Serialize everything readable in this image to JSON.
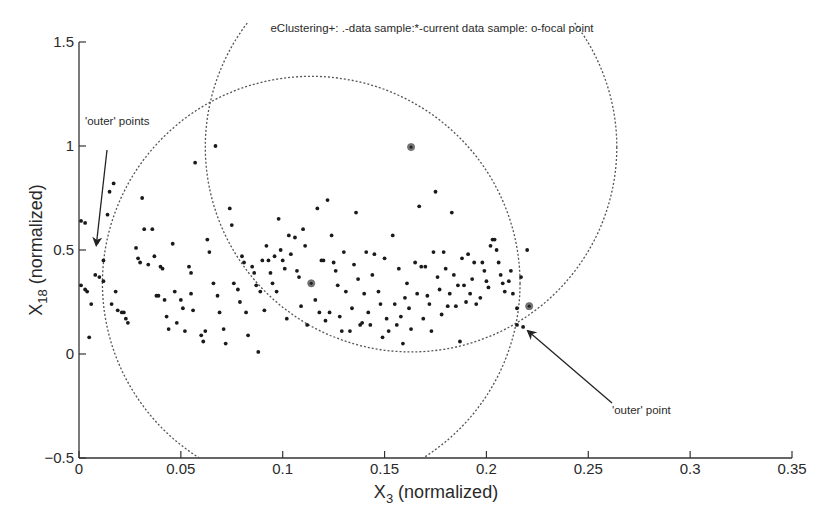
{
  "chart_data": {
    "type": "scatter",
    "title": "eClustering+: .-data sample:*-current data sample: o-focal point",
    "xlabel": "X3 (normalized)",
    "xlabel_main": "X",
    "xlabel_sub": "3",
    "xlabel_rest": " (normalized)",
    "ylabel": "X18 (normalized)",
    "ylabel_main": "X",
    "ylabel_sub": "18",
    "ylabel_rest": " (normalized)",
    "xlim": [
      0,
      0.35
    ],
    "ylim": [
      -0.5,
      1.5
    ],
    "xticks": [
      0,
      0.05,
      0.1,
      0.15,
      0.2,
      0.25,
      0.3,
      0.35
    ],
    "xtick_labels": [
      "0",
      "0.05",
      "0.1",
      "0.15",
      "0.2",
      "0.25",
      "0.3",
      "0.35"
    ],
    "yticks": [
      -0.5,
      0,
      0.5,
      1,
      1.5
    ],
    "ytick_labels": [
      "-0.5",
      "0",
      "0.5",
      "1",
      "1.5"
    ],
    "grid": false,
    "legend": "none",
    "focal_points": [
      {
        "x": 0.163,
        "y": 0.995
      },
      {
        "x": 0.114,
        "y": 0.34
      },
      {
        "x": 0.221,
        "y": 0.23
      }
    ],
    "clusters": [
      {
        "center_x": 0.114,
        "center_y": 0.34,
        "radius_x": 0.1025,
        "radius_y": 0.995
      },
      {
        "center_x": 0.163,
        "center_y": 0.995,
        "radius_x": 0.101,
        "radius_y": 0.985
      }
    ],
    "annotations": [
      {
        "text": "'outer' points",
        "x": 0.001,
        "y": 1.09,
        "arrow_to_x": 0.008,
        "arrow_to_y": 0.62
      },
      {
        "text": "'outer' point",
        "x": 0.22,
        "y": -0.21,
        "arrow_to_x": 0.219,
        "arrow_to_y": 0.15
      }
    ],
    "points": [
      {
        "x": 0.001,
        "y": 0.64
      },
      {
        "x": 0.003,
        "y": 0.63
      },
      {
        "x": 0.001,
        "y": 0.33
      },
      {
        "x": 0.003,
        "y": 0.31
      },
      {
        "x": 0.004,
        "y": 0.3
      },
      {
        "x": 0.006,
        "y": 0.24
      },
      {
        "x": 0.005,
        "y": 0.08
      },
      {
        "x": 0.009,
        "y": 0.54
      },
      {
        "x": 0.008,
        "y": 0.38
      },
      {
        "x": 0.01,
        "y": 0.37
      },
      {
        "x": 0.012,
        "y": 0.35
      },
      {
        "x": 0.012,
        "y": 0.45
      },
      {
        "x": 0.014,
        "y": 0.67
      },
      {
        "x": 0.015,
        "y": 0.78
      },
      {
        "x": 0.017,
        "y": 0.82
      },
      {
        "x": 0.016,
        "y": 0.24
      },
      {
        "x": 0.018,
        "y": 0.3
      },
      {
        "x": 0.019,
        "y": 0.21
      },
      {
        "x": 0.021,
        "y": 0.2
      },
      {
        "x": 0.022,
        "y": 0.2
      },
      {
        "x": 0.023,
        "y": 0.17
      },
      {
        "x": 0.024,
        "y": 0.15
      },
      {
        "x": 0.028,
        "y": 0.51
      },
      {
        "x": 0.029,
        "y": 0.46
      },
      {
        "x": 0.03,
        "y": 0.44
      },
      {
        "x": 0.031,
        "y": 0.75
      },
      {
        "x": 0.032,
        "y": 0.6
      },
      {
        "x": 0.034,
        "y": 0.43
      },
      {
        "x": 0.036,
        "y": 0.6
      },
      {
        "x": 0.037,
        "y": 0.47
      },
      {
        "x": 0.038,
        "y": 0.28
      },
      {
        "x": 0.039,
        "y": 0.28
      },
      {
        "x": 0.04,
        "y": 0.42
      },
      {
        "x": 0.041,
        "y": 0.41
      },
      {
        "x": 0.042,
        "y": 0.26
      },
      {
        "x": 0.043,
        "y": 0.18
      },
      {
        "x": 0.044,
        "y": 0.12
      },
      {
        "x": 0.046,
        "y": 0.53
      },
      {
        "x": 0.047,
        "y": 0.3
      },
      {
        "x": 0.048,
        "y": 0.15
      },
      {
        "x": 0.05,
        "y": 0.26
      },
      {
        "x": 0.051,
        "y": 0.22
      },
      {
        "x": 0.052,
        "y": 0.11
      },
      {
        "x": 0.054,
        "y": 0.42
      },
      {
        "x": 0.055,
        "y": 0.39
      },
      {
        "x": 0.055,
        "y": 0.29
      },
      {
        "x": 0.056,
        "y": 0.21
      },
      {
        "x": 0.057,
        "y": 0.92
      },
      {
        "x": 0.06,
        "y": 0.09
      },
      {
        "x": 0.061,
        "y": 0.06
      },
      {
        "x": 0.062,
        "y": 0.11
      },
      {
        "x": 0.063,
        "y": 0.55
      },
      {
        "x": 0.064,
        "y": 0.49
      },
      {
        "x": 0.066,
        "y": 0.34
      },
      {
        "x": 0.067,
        "y": 1.0
      },
      {
        "x": 0.068,
        "y": 0.28
      },
      {
        "x": 0.069,
        "y": 0.2
      },
      {
        "x": 0.071,
        "y": 0.12
      },
      {
        "x": 0.072,
        "y": 0.05
      },
      {
        "x": 0.074,
        "y": 0.7
      },
      {
        "x": 0.075,
        "y": 0.62
      },
      {
        "x": 0.076,
        "y": 0.34
      },
      {
        "x": 0.078,
        "y": 0.31
      },
      {
        "x": 0.079,
        "y": 0.25
      },
      {
        "x": 0.08,
        "y": 0.47
      },
      {
        "x": 0.081,
        "y": 0.44
      },
      {
        "x": 0.082,
        "y": 0.2
      },
      {
        "x": 0.083,
        "y": 0.09
      },
      {
        "x": 0.085,
        "y": 0.42
      },
      {
        "x": 0.086,
        "y": 0.39
      },
      {
        "x": 0.087,
        "y": 0.33
      },
      {
        "x": 0.088,
        "y": 0.01
      },
      {
        "x": 0.089,
        "y": 0.3
      },
      {
        "x": 0.09,
        "y": 0.45
      },
      {
        "x": 0.091,
        "y": 0.21
      },
      {
        "x": 0.092,
        "y": 0.52
      },
      {
        "x": 0.093,
        "y": 0.45
      },
      {
        "x": 0.094,
        "y": 0.39
      },
      {
        "x": 0.095,
        "y": 0.34
      },
      {
        "x": 0.096,
        "y": 0.47
      },
      {
        "x": 0.097,
        "y": 0.3
      },
      {
        "x": 0.098,
        "y": 0.65
      },
      {
        "x": 0.099,
        "y": 0.5
      },
      {
        "x": 0.1,
        "y": 0.45
      },
      {
        "x": 0.101,
        "y": 0.41
      },
      {
        "x": 0.102,
        "y": 0.17
      },
      {
        "x": 0.103,
        "y": 0.57
      },
      {
        "x": 0.104,
        "y": 0.48
      },
      {
        "x": 0.106,
        "y": 0.56
      },
      {
        "x": 0.107,
        "y": 0.4
      },
      {
        "x": 0.108,
        "y": 0.37
      },
      {
        "x": 0.109,
        "y": 0.23
      },
      {
        "x": 0.11,
        "y": 0.6
      },
      {
        "x": 0.111,
        "y": 0.52
      },
      {
        "x": 0.112,
        "y": 0.14
      },
      {
        "x": 0.116,
        "y": 0.26
      },
      {
        "x": 0.117,
        "y": 0.7
      },
      {
        "x": 0.118,
        "y": 0.2
      },
      {
        "x": 0.119,
        "y": 0.45
      },
      {
        "x": 0.12,
        "y": 0.45
      },
      {
        "x": 0.121,
        "y": 0.16
      },
      {
        "x": 0.122,
        "y": 0.74
      },
      {
        "x": 0.123,
        "y": 0.2
      },
      {
        "x": 0.124,
        "y": 0.57
      },
      {
        "x": 0.125,
        "y": 0.44
      },
      {
        "x": 0.126,
        "y": 0.4
      },
      {
        "x": 0.127,
        "y": 0.33
      },
      {
        "x": 0.128,
        "y": 0.18
      },
      {
        "x": 0.129,
        "y": 0.11
      },
      {
        "x": 0.13,
        "y": 0.49
      },
      {
        "x": 0.131,
        "y": 0.3
      },
      {
        "x": 0.133,
        "y": 0.11
      },
      {
        "x": 0.134,
        "y": 0.22
      },
      {
        "x": 0.135,
        "y": 0.43
      },
      {
        "x": 0.136,
        "y": 0.68
      },
      {
        "x": 0.137,
        "y": 0.36
      },
      {
        "x": 0.138,
        "y": 0.14
      },
      {
        "x": 0.139,
        "y": 0.15
      },
      {
        "x": 0.14,
        "y": 0.29
      },
      {
        "x": 0.141,
        "y": 0.49
      },
      {
        "x": 0.142,
        "y": 0.2
      },
      {
        "x": 0.143,
        "y": 0.14
      },
      {
        "x": 0.144,
        "y": 0.38
      },
      {
        "x": 0.145,
        "y": 0.48
      },
      {
        "x": 0.147,
        "y": 0.3
      },
      {
        "x": 0.148,
        "y": 0.24
      },
      {
        "x": 0.149,
        "y": 0.08
      },
      {
        "x": 0.15,
        "y": 0.46
      },
      {
        "x": 0.151,
        "y": 0.17
      },
      {
        "x": 0.152,
        "y": 0.11
      },
      {
        "x": 0.154,
        "y": 0.57
      },
      {
        "x": 0.155,
        "y": 0.24
      },
      {
        "x": 0.156,
        "y": 0.14
      },
      {
        "x": 0.157,
        "y": 0.41
      },
      {
        "x": 0.158,
        "y": 0.18
      },
      {
        "x": 0.159,
        "y": 0.05
      },
      {
        "x": 0.16,
        "y": 0.27
      },
      {
        "x": 0.161,
        "y": 0.34
      },
      {
        "x": 0.162,
        "y": 0.22
      },
      {
        "x": 0.163,
        "y": 0.12
      },
      {
        "x": 0.165,
        "y": 0.44
      },
      {
        "x": 0.166,
        "y": 0.29
      },
      {
        "x": 0.167,
        "y": 0.71
      },
      {
        "x": 0.168,
        "y": 0.42
      },
      {
        "x": 0.169,
        "y": 0.17
      },
      {
        "x": 0.17,
        "y": 0.42
      },
      {
        "x": 0.171,
        "y": 0.28
      },
      {
        "x": 0.172,
        "y": 0.24
      },
      {
        "x": 0.173,
        "y": 0.11
      },
      {
        "x": 0.174,
        "y": 0.49
      },
      {
        "x": 0.175,
        "y": 0.78
      },
      {
        "x": 0.176,
        "y": 0.37
      },
      {
        "x": 0.177,
        "y": 0.31
      },
      {
        "x": 0.178,
        "y": 0.19
      },
      {
        "x": 0.179,
        "y": 0.49
      },
      {
        "x": 0.18,
        "y": 0.41
      },
      {
        "x": 0.181,
        "y": 0.23
      },
      {
        "x": 0.182,
        "y": 0.29
      },
      {
        "x": 0.183,
        "y": 0.68
      },
      {
        "x": 0.184,
        "y": 0.38
      },
      {
        "x": 0.185,
        "y": 0.23
      },
      {
        "x": 0.186,
        "y": 0.33
      },
      {
        "x": 0.187,
        "y": 0.06
      },
      {
        "x": 0.188,
        "y": 0.46
      },
      {
        "x": 0.189,
        "y": 0.33
      },
      {
        "x": 0.19,
        "y": 0.25
      },
      {
        "x": 0.191,
        "y": 0.48
      },
      {
        "x": 0.192,
        "y": 0.29
      },
      {
        "x": 0.193,
        "y": 0.36
      },
      {
        "x": 0.194,
        "y": 0.44
      },
      {
        "x": 0.195,
        "y": 0.24
      },
      {
        "x": 0.197,
        "y": 0.27
      },
      {
        "x": 0.198,
        "y": 0.44
      },
      {
        "x": 0.199,
        "y": 0.4
      },
      {
        "x": 0.2,
        "y": 0.35
      },
      {
        "x": 0.201,
        "y": 0.32
      },
      {
        "x": 0.202,
        "y": 0.52
      },
      {
        "x": 0.203,
        "y": 0.55
      },
      {
        "x": 0.204,
        "y": 0.55
      },
      {
        "x": 0.205,
        "y": 0.5
      },
      {
        "x": 0.206,
        "y": 0.44
      },
      {
        "x": 0.207,
        "y": 0.38
      },
      {
        "x": 0.208,
        "y": 0.34
      },
      {
        "x": 0.209,
        "y": 0.3
      },
      {
        "x": 0.211,
        "y": 0.35
      },
      {
        "x": 0.212,
        "y": 0.4
      },
      {
        "x": 0.213,
        "y": 0.29
      },
      {
        "x": 0.215,
        "y": 0.14
      },
      {
        "x": 0.215,
        "y": 0.22
      },
      {
        "x": 0.217,
        "y": 0.37
      },
      {
        "x": 0.218,
        "y": 0.13
      },
      {
        "x": 0.22,
        "y": 0.5
      }
    ]
  },
  "plot": {
    "title_text": "eClustering+: .-data sample:*-current data sample: o-focal point",
    "annotation_left": "'outer' points",
    "annotation_right": "'outer' point"
  }
}
